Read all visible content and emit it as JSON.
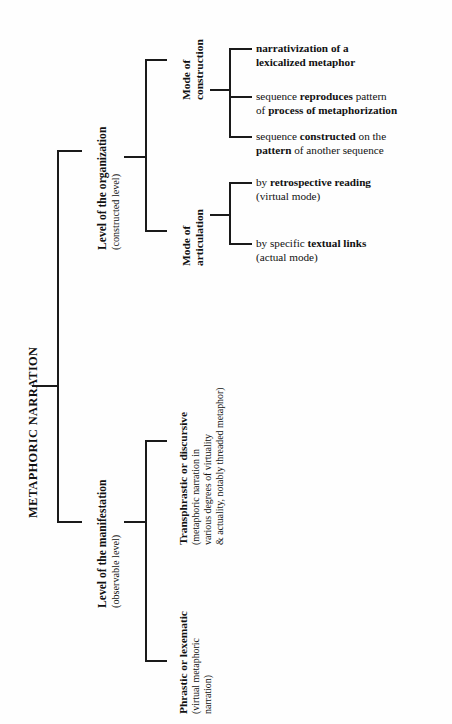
{
  "diagram": {
    "root": {
      "label": "METAPHORIC NARRATION"
    },
    "level_1": [
      {
        "title": "Level of the organization",
        "subtitle": "(constructed level)"
      },
      {
        "title": "Level of the manifestation",
        "subtitle": "(observable level)"
      }
    ],
    "organization_modes": [
      {
        "line1": "Mode of",
        "line2": "construction"
      },
      {
        "line1": "Mode of",
        "line2": "articulation"
      }
    ],
    "construction_leaves": [
      {
        "line1_bold": "narrativization of a",
        "line2_bold": "lexicalized metaphor"
      },
      {
        "l1_a": "sequence ",
        "l1_b": "reproduces",
        "l1_c": " pattern",
        "l2_a": "of ",
        "l2_b": "process of metaphorization",
        "l2_c": ""
      },
      {
        "l1_a": "sequence ",
        "l1_b": "constructed",
        "l1_c": " on the",
        "l2_a": "",
        "l2_b": "pattern",
        "l2_c": " of another sequence"
      }
    ],
    "articulation_leaves": [
      {
        "l1_a": "by ",
        "l1_b": "retrospective reading",
        "l2": "(virtual mode)"
      },
      {
        "l1_a": "by specific ",
        "l1_b": "textual links",
        "l2": "(actual mode)"
      }
    ],
    "manifestation_branches": [
      {
        "title": "Transphrastic or discursive",
        "sub1": "(metaphoric narration in",
        "sub2": "various degrees of virtuality",
        "sub3": "& actuality, notably threaded metaphor)"
      },
      {
        "title": "Phrastic or lexematic",
        "sub1": "(virtual metaphoric",
        "sub2": "narration)"
      }
    ],
    "colors": {
      "line": "#1a1a1a",
      "text": "#111111",
      "background": "#fefefe"
    }
  }
}
